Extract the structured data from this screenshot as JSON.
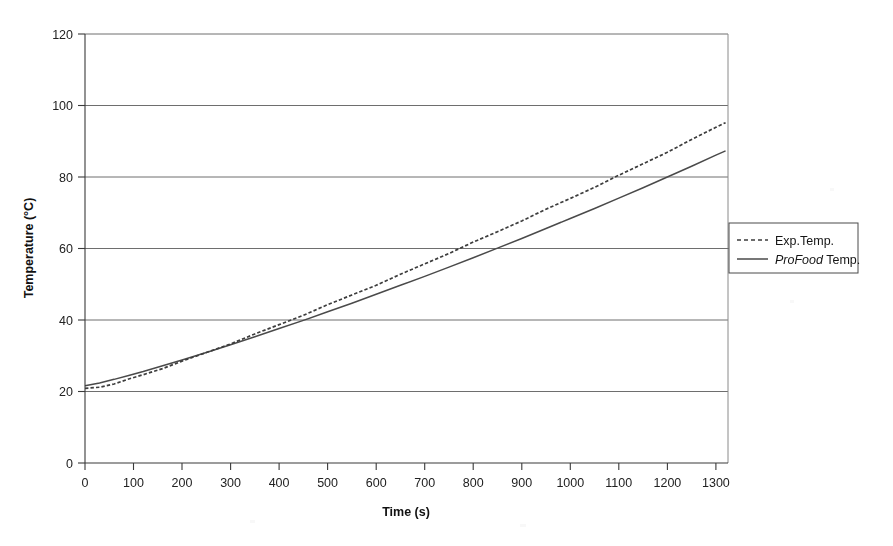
{
  "chart_data": {
    "type": "line",
    "title": "",
    "xlabel": "Time (s)",
    "ylabel": "Temperature (°C)",
    "xlim": [
      0,
      1325
    ],
    "ylim": [
      0,
      120
    ],
    "xticks": [
      0,
      100,
      200,
      300,
      400,
      500,
      600,
      700,
      800,
      900,
      1000,
      1100,
      1200,
      1300
    ],
    "yticks": [
      0,
      20,
      40,
      60,
      80,
      100,
      120
    ],
    "grid": "horizontal",
    "legend_position": "right-outside",
    "series": [
      {
        "name": "Exp.Temp.",
        "style": "dashed",
        "color": "#3d3d3d",
        "x": [
          0,
          30,
          60,
          90,
          120,
          160,
          200,
          250,
          300,
          350,
          400,
          450,
          500,
          550,
          600,
          650,
          700,
          750,
          800,
          850,
          900,
          950,
          1000,
          1050,
          1100,
          1150,
          1200,
          1250,
          1300,
          1320
        ],
        "y": [
          20.8,
          21.2,
          22.2,
          23.4,
          24.7,
          26.5,
          28.4,
          30.9,
          33.4,
          36.0,
          38.7,
          41.4,
          44.2,
          47.0,
          49.8,
          52.7,
          55.7,
          58.7,
          61.7,
          64.7,
          67.8,
          70.9,
          74.0,
          77.2,
          80.4,
          83.7,
          87.0,
          90.4,
          93.9,
          95.3
        ]
      },
      {
        "name": "ProFood Temp.",
        "name_italic_part": "ProFood",
        "name_roman_part": "Temp.",
        "style": "solid",
        "color": "#4a4a4a",
        "x": [
          0,
          30,
          60,
          90,
          120,
          160,
          200,
          250,
          300,
          350,
          400,
          450,
          500,
          550,
          600,
          650,
          700,
          750,
          800,
          850,
          900,
          950,
          1000,
          1050,
          1100,
          1150,
          1200,
          1250,
          1300,
          1320
        ],
        "y": [
          21.6,
          22.4,
          23.4,
          24.5,
          25.6,
          27.2,
          28.8,
          30.9,
          33.1,
          35.3,
          37.6,
          39.9,
          42.3,
          44.7,
          47.2,
          49.7,
          52.2,
          54.8,
          57.4,
          60.1,
          62.8,
          65.6,
          68.4,
          71.2,
          74.1,
          77.0,
          80.0,
          83.0,
          86.1,
          87.3
        ]
      }
    ]
  },
  "legend": {
    "entries": [
      {
        "label": "Exp.Temp.",
        "sample": "dashed-line-sample"
      },
      {
        "label_italic": "ProFood",
        "label_rest": " Temp.",
        "sample": "solid-line-sample"
      }
    ]
  },
  "axes": {
    "x_title": "Time (s)",
    "y_title": "Temperature (°C)",
    "x_tick_labels": [
      "0",
      "100",
      "200",
      "300",
      "400",
      "500",
      "600",
      "700",
      "800",
      "900",
      "1000",
      "1100",
      "1200",
      "1300"
    ],
    "y_tick_labels": [
      "0",
      "20",
      "40",
      "60",
      "80",
      "100",
      "120"
    ]
  },
  "colors": {
    "background": "#ffffff",
    "axis": "#3a3a3a",
    "grid": "#6e6e6e",
    "exp_series": "#3d3d3d",
    "profood_series": "#4a4a4a"
  }
}
